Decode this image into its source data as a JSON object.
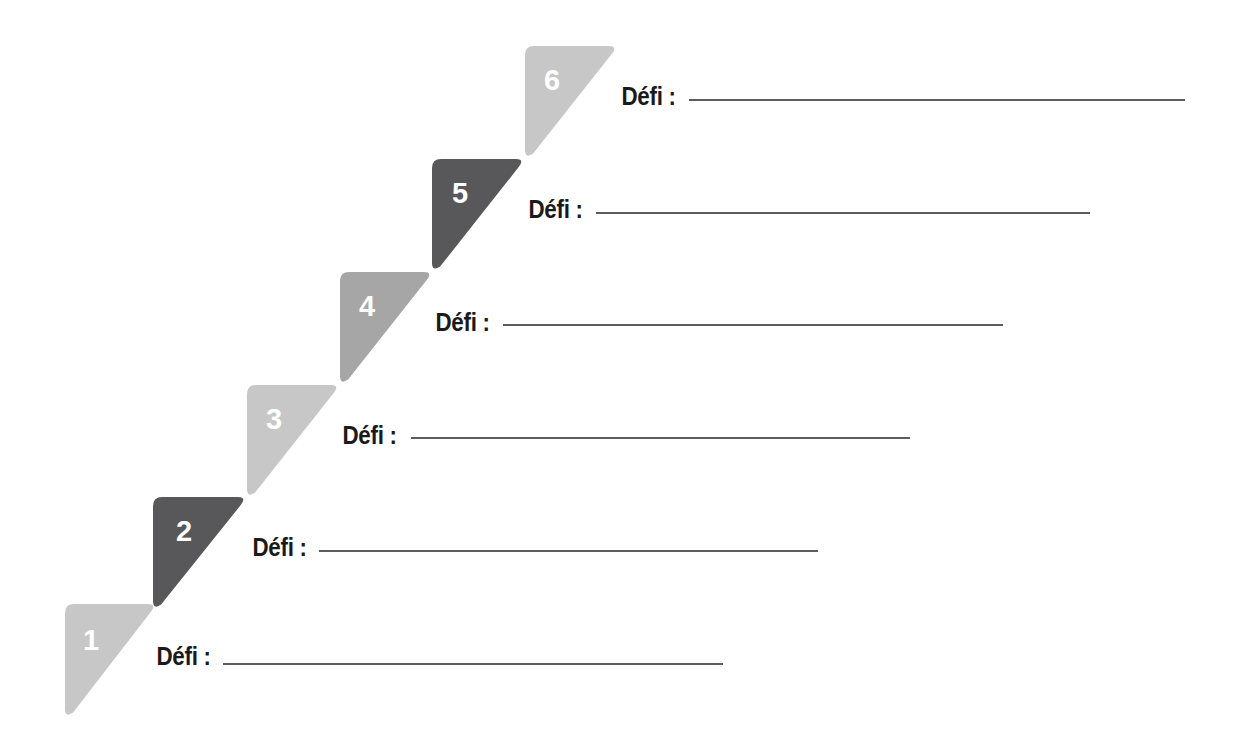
{
  "page": {
    "background": "#ffffff",
    "width": 1249,
    "height": 753
  },
  "palette": {
    "light_gray": "#c7c7c7",
    "medium_gray": "#a6a6a6",
    "dark_gray": "#58585a",
    "rule_color": "#5c5c60",
    "label_color": "#1a1a1a",
    "number_color": "#ffffff"
  },
  "label_text": "Défi :",
  "steps": [
    {
      "number": "1",
      "label": "Défi :",
      "color": "#c7c7c7",
      "shape": "right-triangle-top-left",
      "tri": {
        "x": 65,
        "y": 604,
        "w": 92,
        "h": 114
      },
      "num": {
        "x": 83,
        "y": 626
      },
      "row": {
        "label_x": 152,
        "baseline_y": 667,
        "rule_x": 223,
        "rule_y": 663,
        "rule_w": 500
      }
    },
    {
      "number": "2",
      "label": "Défi :",
      "color": "#58585a",
      "shape": "right-triangle-top-left",
      "tri": {
        "x": 153,
        "y": 497,
        "w": 94,
        "h": 113
      },
      "num": {
        "x": 176,
        "y": 517
      },
      "row": {
        "label_x": 248,
        "baseline_y": 558,
        "rule_x": 319,
        "rule_y": 550,
        "rule_w": 499
      }
    },
    {
      "number": "3",
      "label": "Défi :",
      "color": "#c7c7c7",
      "shape": "right-triangle-top-left",
      "tri": {
        "x": 247,
        "y": 385,
        "w": 93,
        "h": 113
      },
      "num": {
        "x": 266,
        "y": 405
      },
      "row": {
        "label_x": 338,
        "baseline_y": 446,
        "rule_x": 411,
        "rule_y": 437,
        "rule_w": 499
      }
    },
    {
      "number": "4",
      "label": "Défi :",
      "color": "#a6a6a6",
      "shape": "right-triangle-top-left",
      "tri": {
        "x": 340,
        "y": 272,
        "w": 93,
        "h": 113
      },
      "num": {
        "x": 359,
        "y": 292
      },
      "row": {
        "label_x": 431,
        "baseline_y": 333,
        "rule_x": 503,
        "rule_y": 324,
        "rule_w": 500
      }
    },
    {
      "number": "5",
      "label": "Défi :",
      "color": "#58585a",
      "shape": "right-triangle-top-left",
      "tri": {
        "x": 432,
        "y": 159,
        "w": 93,
        "h": 113
      },
      "num": {
        "x": 452,
        "y": 179
      },
      "row": {
        "label_x": 524,
        "baseline_y": 220,
        "rule_x": 596,
        "rule_y": 212,
        "rule_w": 494
      }
    },
    {
      "number": "6",
      "label": "Défi :",
      "color": "#c7c7c7",
      "shape": "right-triangle-top-left",
      "tri": {
        "x": 525,
        "y": 46,
        "w": 93,
        "h": 113
      },
      "num": {
        "x": 544,
        "y": 66
      },
      "row": {
        "label_x": 617,
        "baseline_y": 107,
        "rule_x": 689,
        "rule_y": 99,
        "rule_w": 496
      }
    }
  ]
}
